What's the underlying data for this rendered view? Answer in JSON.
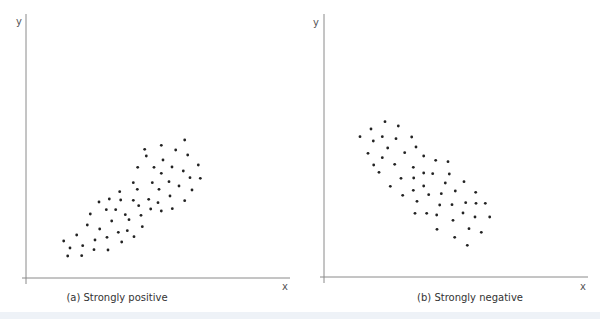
{
  "chart_data": [
    {
      "type": "scatter",
      "title": "(a) Strongly positive",
      "xlabel": "x",
      "ylabel": "y",
      "grid": false,
      "legend": null,
      "axes_px": {
        "origin": [
          26,
          278
        ],
        "x_end": 290,
        "y_top": 14
      },
      "points_px": [
        [
          184.7,
          140
        ],
        [
          144.7,
          149.3
        ],
        [
          161.3,
          145.3
        ],
        [
          175.7,
          150
        ],
        [
          187.7,
          155
        ],
        [
          146.3,
          156
        ],
        [
          163,
          160
        ],
        [
          198.3,
          165
        ],
        [
          137.7,
          167.3
        ],
        [
          154,
          167.3
        ],
        [
          172,
          167
        ],
        [
          183.3,
          171
        ],
        [
          161.3,
          173.3
        ],
        [
          190,
          177.7
        ],
        [
          200.3,
          178.3
        ],
        [
          133.3,
          182.7
        ],
        [
          152.3,
          182.7
        ],
        [
          169,
          181.7
        ],
        [
          179,
          186
        ],
        [
          137.3,
          189.3
        ],
        [
          159,
          189.3
        ],
        [
          192,
          190
        ],
        [
          170,
          196
        ],
        [
          133.3,
          200.3
        ],
        [
          148.7,
          199.3
        ],
        [
          158,
          202.7
        ],
        [
          184.7,
          200.7
        ],
        [
          138.7,
          205.7
        ],
        [
          150.7,
          209
        ],
        [
          161.3,
          211
        ],
        [
          172.3,
          208.7
        ],
        [
          141,
          215.3
        ],
        [
          119.7,
          191.7
        ],
        [
          99,
          202
        ],
        [
          109.3,
          199
        ],
        [
          120.7,
          200
        ],
        [
          106.3,
          209.7
        ],
        [
          115.7,
          209.7
        ],
        [
          90.3,
          214
        ],
        [
          125.3,
          214.7
        ],
        [
          111.7,
          221
        ],
        [
          129,
          219.7
        ],
        [
          87.3,
          225
        ],
        [
          99.7,
          229
        ],
        [
          142.3,
          226.7
        ],
        [
          118.3,
          232.3
        ],
        [
          127.3,
          230.7
        ],
        [
          76.7,
          235
        ],
        [
          107,
          237.3
        ],
        [
          134,
          236.7
        ],
        [
          63.7,
          241
        ],
        [
          95,
          240
        ],
        [
          121.7,
          242
        ],
        [
          70,
          248
        ],
        [
          82.7,
          245.7
        ],
        [
          94,
          249.7
        ],
        [
          108,
          250
        ],
        [
          67.7,
          256
        ],
        [
          81.7,
          255.7
        ]
      ]
    },
    {
      "type": "scatter",
      "title": "(b) Strongly negative",
      "xlabel": "x",
      "ylabel": "y",
      "grid": false,
      "legend": null,
      "axes_px": {
        "origin": [
          324,
          277
        ],
        "x_end": 588,
        "y_top": 14
      },
      "points_px": [
        [
          385,
          121.7
        ],
        [
          398.3,
          126
        ],
        [
          371,
          129
        ],
        [
          360,
          136.7
        ],
        [
          382.3,
          136.7
        ],
        [
          396,
          138.7
        ],
        [
          411.7,
          137
        ],
        [
          373.3,
          141
        ],
        [
          387.7,
          148
        ],
        [
          416,
          147
        ],
        [
          368,
          153.3
        ],
        [
          404.7,
          152.7
        ],
        [
          423.7,
          156
        ],
        [
          382.3,
          157.7
        ],
        [
          394.7,
          164.3
        ],
        [
          373.7,
          165
        ],
        [
          413.3,
          167.3
        ],
        [
          379,
          172.3
        ],
        [
          423.7,
          173
        ],
        [
          401,
          178.3
        ],
        [
          413.7,
          178
        ],
        [
          390.3,
          186.3
        ],
        [
          423.7,
          186
        ],
        [
          435.7,
          160.3
        ],
        [
          448,
          161.7
        ],
        [
          432.7,
          173.7
        ],
        [
          449.3,
          174
        ],
        [
          445.3,
          183
        ],
        [
          464,
          181.7
        ],
        [
          413.3,
          190.3
        ],
        [
          455.3,
          191
        ],
        [
          475.7,
          192.3
        ],
        [
          402.7,
          195.3
        ],
        [
          428.7,
          194.7
        ],
        [
          441.3,
          193.7
        ],
        [
          417,
          201.3
        ],
        [
          439.7,
          205
        ],
        [
          452,
          204.7
        ],
        [
          465.7,
          202.7
        ],
        [
          476,
          203.3
        ],
        [
          485.3,
          203.3
        ],
        [
          415,
          213.3
        ],
        [
          426.7,
          213.3
        ],
        [
          436.7,
          215
        ],
        [
          463,
          213
        ],
        [
          475,
          217
        ],
        [
          489.7,
          217
        ],
        [
          453,
          220.3
        ],
        [
          437,
          229.3
        ],
        [
          469,
          228.7
        ],
        [
          481.3,
          232.3
        ],
        [
          454.7,
          237.3
        ],
        [
          467.3,
          245.3
        ]
      ]
    }
  ],
  "panels": {
    "a": {
      "caption": "(a) Strongly positive",
      "x_label": "x",
      "y_label": "y"
    },
    "b": {
      "caption": "(b) Strongly negative",
      "x_label": "x",
      "y_label": "y"
    }
  },
  "colors": {
    "dot": "#222222",
    "axis": "#8a8a8a",
    "caption_bar": "#eef2f7"
  }
}
